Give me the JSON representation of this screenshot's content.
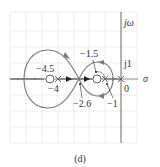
{
  "diagram": {
    "type": "root-locus",
    "caption": "(d)",
    "axes": {
      "imag_label": "jω",
      "real_label": "σ",
      "j1_label": "j1",
      "origin_label": "0"
    },
    "poles": [
      {
        "value": -4,
        "label": "−4"
      },
      {
        "value": -1,
        "label": "−1"
      },
      {
        "value": 0,
        "label": ""
      }
    ],
    "zeros": [
      {
        "value": -4.5,
        "label": "−4.5"
      },
      {
        "value": -1.5,
        "label": "−1.5"
      }
    ],
    "breakpoints": [
      {
        "value": -2.6,
        "label": "−2.6"
      }
    ],
    "colors": {
      "locus": "#7a7a7a",
      "axis": "#555555",
      "grid": "#e6e6e6",
      "arrow": "#222222"
    }
  }
}
